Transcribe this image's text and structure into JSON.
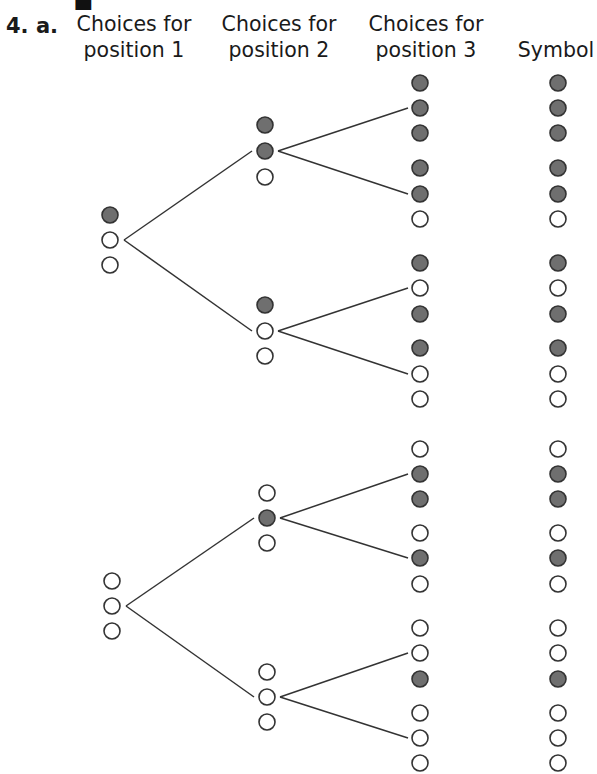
{
  "problem": {
    "number": "4. a."
  },
  "headers": [
    {
      "line1": "Choices for",
      "line2": "position 1"
    },
    {
      "line1": "Choices for",
      "line2": "position 2"
    },
    {
      "line1": "Choices for",
      "line2": "position 3"
    },
    {
      "line1": "",
      "line2": "Symbol"
    }
  ],
  "colors": {
    "filled": "#6f6f6f",
    "stroke": "#333333",
    "empty": "#ffffff",
    "line": "#333333"
  },
  "legend": {
    "filled": "dark circle",
    "empty": "open circle"
  },
  "tree": {
    "groups": [
      {
        "position1": {
          "x": 110,
          "ys": [
            215,
            240,
            265
          ],
          "states": [
            1,
            0,
            0
          ],
          "branch_index": 1
        },
        "children": [
          {
            "position2": {
              "x": 265,
              "ys": [
                125,
                151,
                177
              ],
              "states": [
                1,
                1,
                0
              ],
              "branch_index": 1
            },
            "children": [
              {
                "position3": {
                  "ys": [
                    83,
                    108,
                    133
                  ],
                  "states": [
                    1,
                    1,
                    1
                  ]
                },
                "symbol": [
                  1,
                  1,
                  1
                ]
              },
              {
                "position3": {
                  "ys": [
                    168,
                    194,
                    219
                  ],
                  "states": [
                    1,
                    1,
                    0
                  ]
                },
                "symbol": [
                  1,
                  1,
                  0
                ]
              }
            ]
          },
          {
            "position2": {
              "x": 265,
              "ys": [
                305,
                331,
                356
              ],
              "states": [
                1,
                0,
                0
              ],
              "branch_index": 1
            },
            "children": [
              {
                "position3": {
                  "ys": [
                    263,
                    288,
                    314
                  ],
                  "states": [
                    1,
                    0,
                    1
                  ]
                },
                "symbol": [
                  1,
                  0,
                  1
                ]
              },
              {
                "position3": {
                  "ys": [
                    348,
                    374,
                    399
                  ],
                  "states": [
                    1,
                    0,
                    0
                  ]
                },
                "symbol": [
                  1,
                  0,
                  0
                ]
              }
            ]
          }
        ]
      },
      {
        "position1": {
          "x": 112,
          "ys": [
            581,
            606,
            631
          ],
          "states": [
            0,
            0,
            0
          ],
          "branch_index": 1
        },
        "children": [
          {
            "position2": {
              "x": 267,
              "ys": [
                493,
                518,
                543
              ],
              "states": [
                0,
                1,
                0
              ],
              "branch_index": 1
            },
            "children": [
              {
                "position3": {
                  "ys": [
                    449,
                    474,
                    499
                  ],
                  "states": [
                    0,
                    1,
                    1
                  ]
                },
                "symbol": [
                  0,
                  1,
                  1
                ]
              },
              {
                "position3": {
                  "ys": [
                    533,
                    558,
                    584
                  ],
                  "states": [
                    0,
                    1,
                    0
                  ]
                },
                "symbol": [
                  0,
                  1,
                  0
                ]
              }
            ]
          },
          {
            "position2": {
              "x": 267,
              "ys": [
                672,
                697,
                722
              ],
              "states": [
                0,
                0,
                0
              ],
              "branch_index": 1
            },
            "children": [
              {
                "position3": {
                  "ys": [
                    628,
                    653,
                    679
                  ],
                  "states": [
                    0,
                    0,
                    1
                  ]
                },
                "symbol": [
                  0,
                  0,
                  1
                ]
              },
              {
                "position3": {
                  "ys": [
                    713,
                    738,
                    763
                  ],
                  "states": [
                    0,
                    0,
                    0
                  ]
                },
                "symbol": [
                  0,
                  0,
                  0
                ]
              }
            ]
          }
        ]
      }
    ],
    "position3_x": 420,
    "symbol_x": 558,
    "radius": 8
  }
}
